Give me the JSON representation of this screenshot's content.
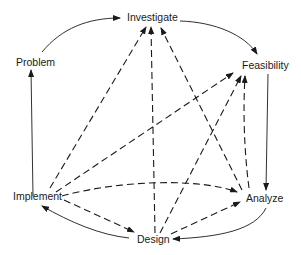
{
  "diagram": {
    "type": "process-cycle",
    "nodes": [
      {
        "id": "investigate",
        "label": "Investigate"
      },
      {
        "id": "feasibility",
        "label": "Feasibility"
      },
      {
        "id": "analyze",
        "label": "Analyze"
      },
      {
        "id": "design",
        "label": "Design"
      },
      {
        "id": "implement",
        "label": "Implement"
      },
      {
        "id": "problem",
        "label": "Problem"
      }
    ],
    "edges_solid": [
      {
        "from": "problem",
        "to": "investigate"
      },
      {
        "from": "investigate",
        "to": "feasibility"
      },
      {
        "from": "feasibility",
        "to": "analyze"
      },
      {
        "from": "analyze",
        "to": "design"
      },
      {
        "from": "design",
        "to": "implement"
      },
      {
        "from": "implement",
        "to": "problem"
      }
    ],
    "edges_dashed": [
      {
        "from": "implement",
        "to": "investigate"
      },
      {
        "from": "implement",
        "to": "feasibility"
      },
      {
        "from": "implement",
        "to": "analyze"
      },
      {
        "from": "implement",
        "to": "design"
      },
      {
        "from": "design",
        "to": "investigate"
      },
      {
        "from": "design",
        "to": "feasibility"
      },
      {
        "from": "design",
        "to": "analyze"
      },
      {
        "from": "analyze",
        "to": "investigate"
      },
      {
        "from": "analyze",
        "to": "feasibility"
      }
    ],
    "colors": {
      "line": "#1a1a1a",
      "background": "#ffffff"
    }
  }
}
